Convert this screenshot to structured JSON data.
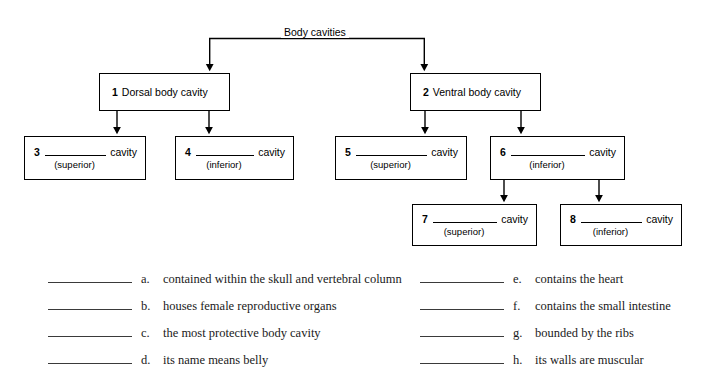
{
  "diagram": {
    "root": {
      "label": "Body cavities"
    },
    "nodes": [
      {
        "id": "node-1",
        "number": "1",
        "name": "Dorsal body cavity",
        "kind": "named"
      },
      {
        "id": "node-2",
        "number": "2",
        "name": "Ventral body cavity",
        "kind": "named"
      },
      {
        "id": "node-3",
        "number": "3",
        "cavity_word": "cavity",
        "hint": "(superior)",
        "kind": "blank"
      },
      {
        "id": "node-4",
        "number": "4",
        "cavity_word": "cavity",
        "hint": "(inferior)",
        "kind": "blank"
      },
      {
        "id": "node-5",
        "number": "5",
        "cavity_word": "cavity",
        "hint": "(superior)",
        "kind": "blank"
      },
      {
        "id": "node-6",
        "number": "6",
        "cavity_word": "cavity",
        "hint": "(inferior)",
        "kind": "blank"
      },
      {
        "id": "node-7",
        "number": "7",
        "cavity_word": "cavity",
        "hint": "(superior)",
        "kind": "blank"
      },
      {
        "id": "node-8",
        "number": "8",
        "cavity_word": "cavity",
        "hint": "(inferior)",
        "kind": "blank"
      }
    ]
  },
  "answers": {
    "left": [
      {
        "letter": "a.",
        "text": "contained within the skull and vertebral column"
      },
      {
        "letter": "b.",
        "text": "houses female reproductive organs"
      },
      {
        "letter": "c.",
        "text": "the most protective body cavity"
      },
      {
        "letter": "d.",
        "text": "its name means belly"
      }
    ],
    "right": [
      {
        "letter": "e.",
        "text": "contains the heart"
      },
      {
        "letter": "f.",
        "text": "contains the small intestine"
      },
      {
        "letter": "g.",
        "text": "bounded by the ribs"
      },
      {
        "letter": "h.",
        "text": "its walls are muscular"
      }
    ]
  },
  "colors": {
    "stroke": "#000000",
    "background": "#ffffff",
    "text": "#000000",
    "answer_text": "#1a1a1a"
  }
}
